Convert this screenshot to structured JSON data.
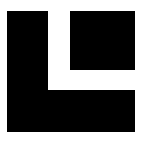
{
  "canvas": {
    "width": 149,
    "height": 144,
    "background": "#ffffff"
  },
  "logo": {
    "color": "#000000",
    "shapes": [
      {
        "name": "l-vertical-bar",
        "x": 7,
        "y": 11,
        "w": 41,
        "h": 121
      },
      {
        "name": "l-horizontal-bar",
        "x": 7,
        "y": 90,
        "w": 128,
        "h": 42
      },
      {
        "name": "square-block",
        "x": 70,
        "y": 11,
        "w": 65,
        "h": 59
      }
    ]
  }
}
